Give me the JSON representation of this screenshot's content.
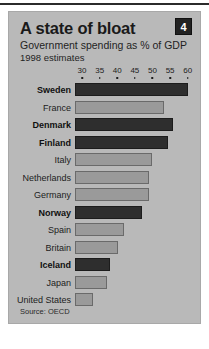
{
  "card": {
    "badge": "4",
    "title": "A state of  bloat",
    "subtitle": "Government spending as % of GDP",
    "subtitle2": "1998 estimates",
    "source": "Source: OECD"
  },
  "chart_data": {
    "type": "bar",
    "orientation": "horizontal",
    "title": "A state of  bloat",
    "subtitle": "Government spending as % of GDP",
    "note": "1998 estimates",
    "xlabel": "",
    "ylabel": "",
    "xlim": [
      28,
      61.5
    ],
    "ticks": [
      30,
      35,
      40,
      45,
      50,
      55,
      60
    ],
    "grid": false,
    "legend": "none",
    "source": "Source: OECD",
    "categories": [
      "Sweden",
      "France",
      "Denmark",
      "Finland",
      "Italy",
      "Netherlands",
      "Germany",
      "Norway",
      "Spain",
      "Britain",
      "Iceland",
      "Japan",
      "United States"
    ],
    "values": [
      60.1,
      53.2,
      55.9,
      54.5,
      49.8,
      49.0,
      48.9,
      47.0,
      41.8,
      40.2,
      38.0,
      37.2,
      33.0
    ],
    "emphasis": [
      true,
      false,
      true,
      true,
      false,
      false,
      false,
      true,
      false,
      false,
      true,
      false,
      false
    ],
    "colors": {
      "dark": "#2e2e2e",
      "light": "#9a9a9a",
      "panel": "#b9b9b9",
      "badge": "#222222",
      "text": "#1c1c1c"
    }
  }
}
